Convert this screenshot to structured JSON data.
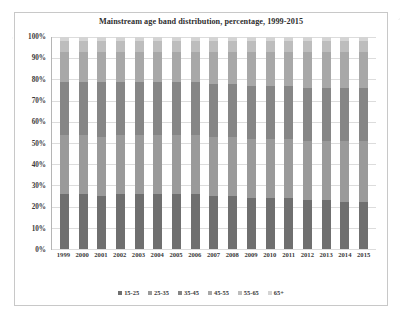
{
  "chart_data": {
    "type": "bar",
    "subtype": "100% stacked column",
    "title": "Mainstream age band distribution, percentage, 1999-2015",
    "xlabel": "",
    "ylabel": "",
    "ylim": [
      0,
      100
    ],
    "ytick_labels": [
      "100%",
      "90%",
      "80%",
      "70%",
      "60%",
      "50%",
      "40%",
      "30%",
      "20%",
      "10%",
      "0%"
    ],
    "ytick_values": [
      100,
      90,
      80,
      70,
      60,
      50,
      40,
      30,
      20,
      10,
      0
    ],
    "grid": true,
    "legend_position": "bottom",
    "categories": [
      "1999",
      "2000",
      "2001",
      "2002",
      "2003",
      "2004",
      "2005",
      "2006",
      "2007",
      "2008",
      "2009",
      "2010",
      "2011",
      "2012",
      "2013",
      "2014",
      "2015"
    ],
    "series": [
      {
        "name": "15-25",
        "color": "#6f6f6f",
        "values": [
          26,
          26,
          25,
          26,
          26,
          26,
          26,
          26,
          25,
          25,
          24,
          24,
          24,
          23,
          23,
          22,
          22
        ]
      },
      {
        "name": "25-35",
        "color": "#9a9a9a",
        "values": [
          28,
          28,
          28,
          28,
          28,
          28,
          28,
          28,
          28,
          28,
          28,
          28,
          28,
          28,
          28,
          29,
          29
        ]
      },
      {
        "name": "35-45",
        "color": "#868686",
        "values": [
          25,
          25,
          26,
          25,
          25,
          25,
          25,
          25,
          25,
          25,
          25,
          25,
          25,
          25,
          25,
          25,
          25
        ]
      },
      {
        "name": "45-55",
        "color": "#a8a8a8",
        "values": [
          14,
          14,
          14,
          14,
          14,
          14,
          14,
          14,
          15,
          15,
          16,
          16,
          16,
          17,
          17,
          17,
          17
        ]
      },
      {
        "name": "55-65",
        "color": "#bdbdbd",
        "values": [
          5,
          5,
          5,
          5,
          5,
          5,
          5,
          5,
          5,
          5,
          5,
          5,
          5,
          5,
          5,
          5,
          5
        ]
      },
      {
        "name": "65+",
        "color": "#d4d4d4",
        "values": [
          2,
          2,
          2,
          2,
          2,
          2,
          2,
          2,
          2,
          2,
          2,
          2,
          2,
          2,
          2,
          2,
          2
        ]
      }
    ]
  }
}
